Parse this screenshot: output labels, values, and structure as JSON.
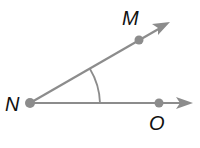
{
  "diagram": {
    "type": "angle",
    "name": "angle MNO",
    "vertex": {
      "label": "N",
      "x": 30,
      "y": 103
    },
    "rays": [
      {
        "name": "ray-NM",
        "point_label": "M",
        "point": {
          "x": 139,
          "y": 40
        },
        "tip": {
          "x": 169,
          "y": 22
        }
      },
      {
        "name": "ray-NO",
        "point_label": "O",
        "point": {
          "x": 159,
          "y": 103
        },
        "tip": {
          "x": 192,
          "y": 103
        }
      }
    ],
    "labels": {
      "N": "N",
      "M": "M",
      "O": "O"
    },
    "colors": {
      "ray": "#8c8c8c",
      "point": "#8c8c8c",
      "arc": "#8c8c8c",
      "label": "#111111"
    },
    "angle_marker": "single-arc"
  }
}
